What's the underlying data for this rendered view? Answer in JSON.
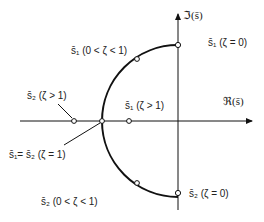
{
  "diagram": {
    "type": "root-locus",
    "axes": {
      "imag_label": "ℑ(s̄)",
      "real_label": "ℜ(s̄)"
    },
    "labels": {
      "s1_underdamped": "s̄₁ (0 < ζ < 1)",
      "s1_undamped": "s̄₁ (ζ = 0)",
      "s2_overdamped": "s̄₂ (ζ > 1)",
      "s1_overdamped": "s̄₁ (ζ > 1)",
      "critical": "s̄₁= s̄₂ (ζ = 1)",
      "s2_underdamped": "s̄₂ (0 < ζ < 1)",
      "s2_undamped": "s̄₂ (ζ = 0)"
    },
    "colors": {
      "line": "#111111",
      "text": "#222222"
    }
  }
}
